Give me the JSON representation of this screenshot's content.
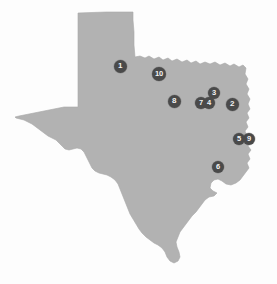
{
  "figure": {
    "name": "texas-state-map",
    "region_label": "Texas",
    "background_color": "#fdfdfd",
    "state_fill_color": "#b2b2b2",
    "state_outline_color": "#a8a8a8",
    "marker_fill_color": "#4a4a4a",
    "marker_text_color": "#f2f2f2"
  },
  "markers": [
    {
      "label": "1",
      "x": 120,
      "y": 66,
      "d": 13
    },
    {
      "label": "10",
      "x": 159,
      "y": 74,
      "d": 14
    },
    {
      "label": "8",
      "x": 174,
      "y": 101,
      "d": 13
    },
    {
      "label": "3",
      "x": 214,
      "y": 93,
      "d": 12
    },
    {
      "label": "7",
      "x": 201,
      "y": 103,
      "d": 12
    },
    {
      "label": "4",
      "x": 209,
      "y": 103,
      "d": 12
    },
    {
      "label": "2",
      "x": 232,
      "y": 104,
      "d": 13
    },
    {
      "label": "5",
      "x": 239,
      "y": 139,
      "d": 12
    },
    {
      "label": "9",
      "x": 249,
      "y": 139,
      "d": 12
    },
    {
      "label": "6",
      "x": 218,
      "y": 167,
      "d": 12
    }
  ]
}
